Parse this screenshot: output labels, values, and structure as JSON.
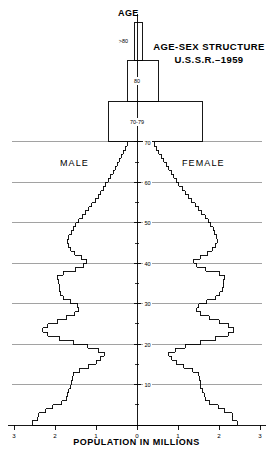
{
  "figure": {
    "title_line1": "AGE-SEX STRUCTURE",
    "title_line2": "U.S.S.R.–1959",
    "age_axis_label": "AGE",
    "male_label": "MALE",
    "female_label": "FEMALE",
    "x_axis_label": "POPULATION IN MILLIONS",
    "line_color": "#000000",
    "grid_color": "#7a7a7a",
    "background": "#ffffff"
  },
  "chart_data": {
    "type": "bar",
    "title": "AGE-SEX STRUCTURE U.S.S.R.–1959",
    "subtitle": "Population pyramid, single-year age cohorts",
    "xlabel": "POPULATION IN MILLIONS",
    "ylabel": "AGE",
    "orientation": "horizontal-pyramid",
    "grid": true,
    "legend_position": "inline-sides",
    "legend": [
      "MALE",
      "FEMALE"
    ],
    "xlim": [
      -3,
      3
    ],
    "ylim": [
      0,
      80
    ],
    "x_tick_labels": [
      "3",
      "2",
      "1",
      "0",
      "1",
      "2",
      "3"
    ],
    "x_tick_values": [
      -3,
      -2,
      -1,
      0,
      1,
      2,
      3
    ],
    "y_tick_labels": [
      "10",
      "20",
      "30",
      "40",
      "50",
      "60",
      "70"
    ],
    "y_tick_values": [
      10,
      20,
      30,
      40,
      50,
      60,
      70
    ],
    "y_minor_tick_values": [
      5,
      15,
      25,
      35,
      45,
      55,
      65,
      75
    ],
    "grouped_band_labels": [
      "70-79",
      "80",
      ">80"
    ],
    "ages": [
      0,
      1,
      2,
      3,
      4,
      5,
      6,
      7,
      8,
      9,
      10,
      11,
      12,
      13,
      14,
      15,
      16,
      17,
      18,
      19,
      20,
      21,
      22,
      23,
      24,
      25,
      26,
      27,
      28,
      29,
      30,
      31,
      32,
      33,
      34,
      35,
      36,
      37,
      38,
      39,
      40,
      41,
      42,
      43,
      44,
      45,
      46,
      47,
      48,
      49,
      50,
      51,
      52,
      53,
      54,
      55,
      56,
      57,
      58,
      59,
      60,
      61,
      62,
      63,
      64,
      65,
      66,
      67,
      68,
      69
    ],
    "series": [
      {
        "name": "MALE",
        "units": "millions",
        "values": [
          2.55,
          2.42,
          2.4,
          2.22,
          2.05,
          1.83,
          1.72,
          1.7,
          1.66,
          1.62,
          1.6,
          1.58,
          1.55,
          1.4,
          1.18,
          1.0,
          0.88,
          0.8,
          0.95,
          1.2,
          1.55,
          1.9,
          2.18,
          2.3,
          2.18,
          1.95,
          1.72,
          1.52,
          1.42,
          1.45,
          1.62,
          1.8,
          1.86,
          1.9,
          1.9,
          1.92,
          1.94,
          1.8,
          1.5,
          1.3,
          1.22,
          1.36,
          1.52,
          1.62,
          1.68,
          1.7,
          1.66,
          1.6,
          1.55,
          1.5,
          1.42,
          1.34,
          1.26,
          1.18,
          1.1,
          1.02,
          0.95,
          0.88,
          0.82,
          0.76,
          0.7,
          0.64,
          0.58,
          0.53,
          0.48,
          0.43,
          0.38,
          0.33,
          0.28,
          0.24
        ]
      },
      {
        "name": "FEMALE",
        "units": "millions",
        "values": [
          2.45,
          2.34,
          2.32,
          2.14,
          1.98,
          1.77,
          1.66,
          1.64,
          1.6,
          1.56,
          1.55,
          1.53,
          1.5,
          1.36,
          1.14,
          0.96,
          0.85,
          0.78,
          0.93,
          1.18,
          1.55,
          1.92,
          2.22,
          2.36,
          2.24,
          2.0,
          1.76,
          1.56,
          1.46,
          1.5,
          1.7,
          1.92,
          2.02,
          2.08,
          2.1,
          2.12,
          2.14,
          2.0,
          1.68,
          1.46,
          1.38,
          1.54,
          1.72,
          1.84,
          1.92,
          1.96,
          1.94,
          1.9,
          1.86,
          1.8,
          1.74,
          1.66,
          1.58,
          1.5,
          1.42,
          1.34,
          1.26,
          1.18,
          1.1,
          1.02,
          0.96,
          0.9,
          0.83,
          0.77,
          0.71,
          0.65,
          0.59,
          0.53,
          0.47,
          0.42
        ]
      }
    ],
    "aggregate_bands": [
      {
        "label": "70-79",
        "male": 0.7,
        "female": 1.6
      },
      {
        "label": "80",
        "male": 0.22,
        "female": 0.52
      },
      {
        "label": ">80",
        "male": 0.06,
        "female": 0.14
      }
    ],
    "annotations": [
      "Deep notch at ages 14-18 reflects World War II birth deficit",
      "Notch at ages 26-28 reflects the 1932-33 famine birth deficit",
      "Notch at ages 38-42 reflects World War I and Civil War birth deficit",
      "Male shortfall above age 30 reflects World War II military losses"
    ]
  }
}
